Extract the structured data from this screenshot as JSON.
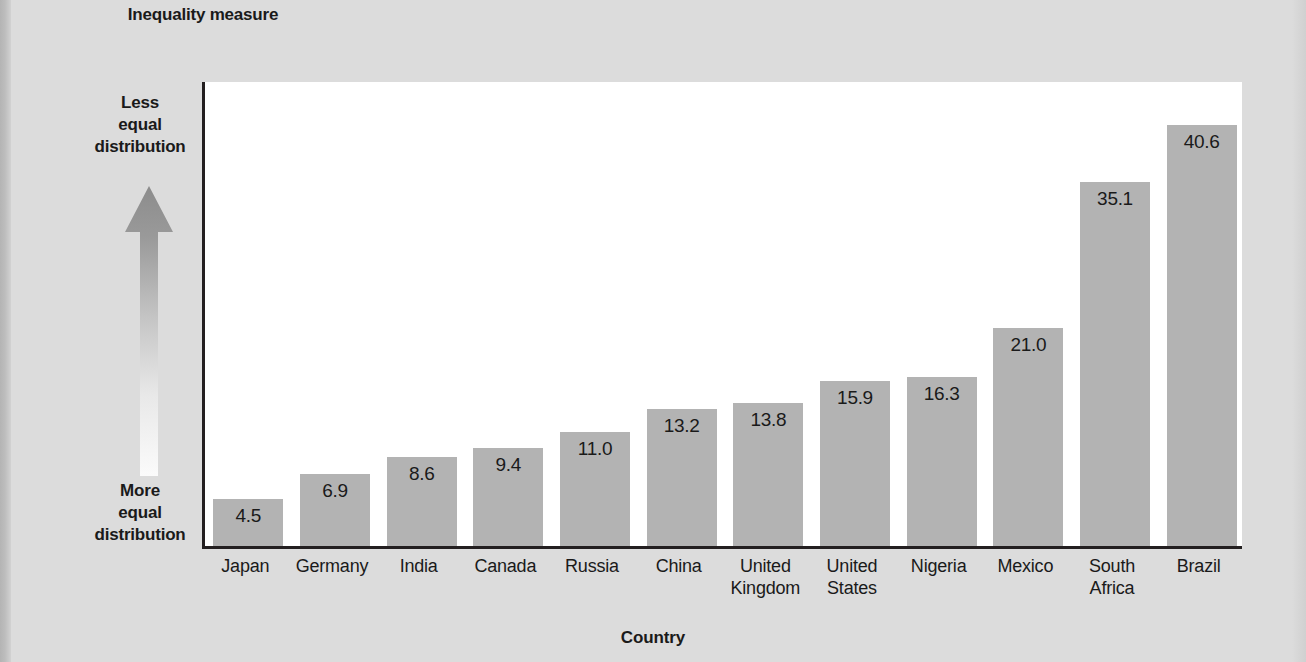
{
  "page": {
    "background_color": "#dcdcdc",
    "plot_background_color": "#ffffff",
    "axis_color": "#231f20",
    "bar_color": "#b3b3b3",
    "text_color": "#1a1a1a"
  },
  "axis_annotations": {
    "arrow_icon": "up-arrow-gradient-icon",
    "top_label_line1": "Less",
    "top_label_line2": "equal",
    "top_label_line3": "distribution",
    "bottom_label_line1": "More",
    "bottom_label_line2": "equal",
    "bottom_label_line3": "distribution"
  },
  "chart_data": {
    "type": "bar",
    "title": "",
    "ylabel": "Inequality measure",
    "xlabel": "Country",
    "ylim": [
      0,
      45
    ],
    "grid": false,
    "legend": null,
    "orientation": "vertical",
    "value_label_position": "inside-top",
    "categories": [
      "Japan",
      "Germany",
      "India",
      "Canada",
      "Russia",
      "China",
      "United Kingdom",
      "United States",
      "Nigeria",
      "Mexico",
      "South Africa",
      "Brazil"
    ],
    "category_lines": [
      [
        "Japan"
      ],
      [
        "Germany"
      ],
      [
        "India"
      ],
      [
        "Canada"
      ],
      [
        "Russia"
      ],
      [
        "China"
      ],
      [
        "United",
        "Kingdom"
      ],
      [
        "United",
        "States"
      ],
      [
        "Nigeria"
      ],
      [
        "Mexico"
      ],
      [
        "South",
        "Africa"
      ],
      [
        "Brazil"
      ]
    ],
    "values": [
      4.5,
      6.9,
      8.6,
      9.4,
      11.0,
      13.2,
      13.8,
      15.9,
      16.3,
      21.0,
      35.1,
      40.6
    ],
    "value_labels": [
      "4.5",
      "6.9",
      "8.6",
      "9.4",
      "11.0",
      "13.2",
      "13.8",
      "15.9",
      "16.3",
      "21.0",
      "35.1",
      "40.6"
    ]
  }
}
